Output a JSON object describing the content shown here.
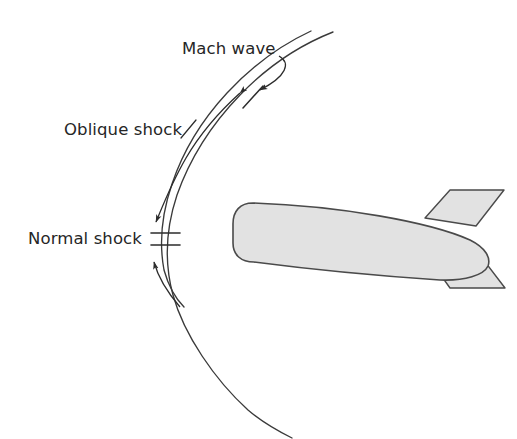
{
  "figure": {
    "background_color": "#ffffff",
    "line_color": "#3a3a3a",
    "text_color": "#262626",
    "body_fill_color": "#e2e2e2",
    "body_stroke_color": "#4a4a4a",
    "fin_fill_color": "#e2e2e2"
  },
  "labels": {
    "mach_wave": "Mach wave",
    "oblique_shock": "Oblique shock",
    "normal_shock": "Normal shock"
  },
  "annotations": [
    {
      "name": "mach-wave",
      "text": "Mach wave",
      "x": 182,
      "y": 54,
      "leader": "curve-from-label-down-right-to-outer-wave",
      "arrow_target_x": 249,
      "arrow_target_y": 91
    },
    {
      "name": "oblique-shock",
      "text": "Oblique shock",
      "x": 64,
      "y": 134,
      "leader": "long-curve-along-inner-shock-with-two-arrowheads",
      "arrow_target_x": 150,
      "arrow_target_y": 225
    },
    {
      "name": "normal-shock",
      "text": "Normal shock",
      "x": 28,
      "y": 242,
      "leader": "two-arrows-and-double-tick-marks-at-shock-apex",
      "arrow_target_x": 152,
      "arrow_target_y": 252
    }
  ],
  "shock_waves": [
    {
      "name": "inner-bow-shock",
      "type": "oblique-and-normal-shock",
      "description": "Inner detached bow shock, normal at the apex and oblique along the flanks"
    },
    {
      "name": "outer-mach-wave",
      "type": "mach-wave",
      "description": "Outer curve weakening into a Mach wave far from the body"
    }
  ],
  "vehicle": {
    "name": "blunt-nosed-supersonic-body",
    "nose_direction": "left",
    "parts": [
      "fuselage",
      "upper-tail-fin",
      "lower-tail-fin"
    ]
  },
  "tick_marks": [
    {
      "name": "mach-wave-tick",
      "x": 253,
      "y": 97
    },
    {
      "name": "normal-shock-tick-upper",
      "x": 165,
      "y": 233
    },
    {
      "name": "normal-shock-tick-lower",
      "x": 165,
      "y": 245
    }
  ]
}
